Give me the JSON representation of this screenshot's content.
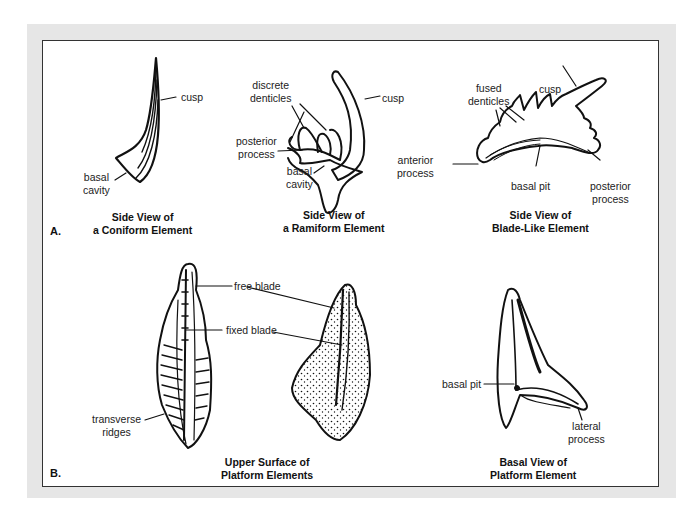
{
  "figure": {
    "section_a": {
      "marker": "A.",
      "elements": [
        {
          "id": "coniform",
          "caption": [
            "Side View of",
            "a Coniform Element"
          ],
          "labels": {
            "cusp": "cusp",
            "basal_cavity": [
              "basal",
              "cavity"
            ]
          }
        },
        {
          "id": "ramiform",
          "caption": [
            "Side View of",
            "a Ramiform Element"
          ],
          "labels": {
            "discrete_denticles": [
              "discrete",
              "denticles"
            ],
            "cusp": "cusp",
            "posterior_process": [
              "posterior",
              "process"
            ],
            "basal_cavity": [
              "basal",
              "cavity"
            ]
          }
        },
        {
          "id": "blade_like",
          "caption": [
            "Side View of",
            "Blade-Like Element"
          ],
          "labels": {
            "fused_denticles": [
              "fused",
              "denticles"
            ],
            "cusp": "cusp",
            "anterior_process": [
              "anterior",
              "process"
            ],
            "basal_pit": "basal pit",
            "posterior_process": [
              "posterior",
              "process"
            ]
          }
        }
      ]
    },
    "section_b": {
      "marker": "B.",
      "elements": [
        {
          "id": "platform_upper",
          "caption": [
            "Upper Surface of",
            "Platform Elements"
          ],
          "labels": {
            "free_blade": "free blade",
            "fixed_blade": "fixed blade",
            "transverse_ridges": [
              "transverse",
              "ridges"
            ]
          }
        },
        {
          "id": "platform_basal",
          "caption": [
            "Basal View of",
            "Platform Element"
          ],
          "labels": {
            "basal_pit": "basal pit",
            "lateral_process": [
              "lateral",
              "process"
            ]
          }
        }
      ]
    },
    "colors": {
      "frame": "#e6e6e6",
      "border": "#333333",
      "ink": "#111111"
    }
  }
}
